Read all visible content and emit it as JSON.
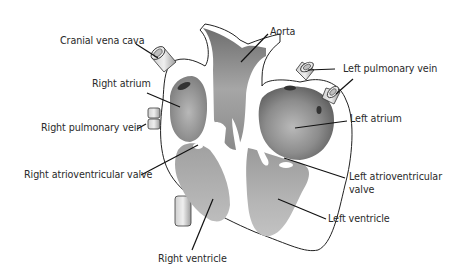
{
  "diagram": {
    "labels": {
      "cranial_vena_cava": "Cranial vena cava",
      "aorta": "Aorta",
      "right_atrium": "Right atrium",
      "left_pulmonary_vein": "Left pulmonary vein",
      "right_pulmonary_vein": "Right pulmonary vein",
      "left_atrium": "Left atrium",
      "right_atrioventricular_valve": "Right atrioventricular valve",
      "left_atrioventricular_valve_line1": "Left atrioventricular",
      "left_atrioventricular_valve_line2": "valve",
      "left_ventricle": "Left ventricle",
      "right_ventricle": "Right ventricle"
    },
    "colors": {
      "text": "#2a2a2a",
      "outline": "#1e1e1e",
      "chamber_dark": "#7a7a7a",
      "chamber_mid": "#a3a3a3",
      "chamber_light": "#c9c9c9",
      "wall": "#ffffff",
      "background": "#ffffff"
    }
  }
}
